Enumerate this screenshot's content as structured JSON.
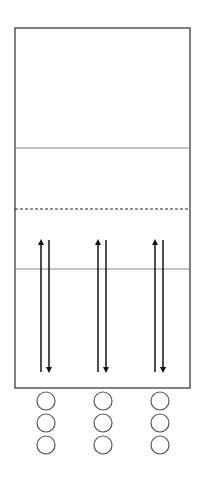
{
  "diagram": {
    "type": "court-drill-diagram",
    "colors": {
      "stroke": "#555555",
      "arrow": "#111111",
      "line": "#888888",
      "background": "#ffffff"
    },
    "court": {
      "x": 15,
      "y": 28,
      "width": 175,
      "height": 360
    },
    "lines": [
      {
        "name": "line-upper",
        "y": 148,
        "style": "solid"
      },
      {
        "name": "line-dashed",
        "y": 209,
        "style": "dashed"
      },
      {
        "name": "line-lower",
        "y": 269,
        "style": "solid"
      }
    ],
    "columns": [
      {
        "name": "column-1",
        "up_x": 41,
        "down_x": 49,
        "circle_x": 46
      },
      {
        "name": "column-2",
        "up_x": 98,
        "down_x": 106,
        "circle_x": 103
      },
      {
        "name": "column-3",
        "up_x": 155,
        "down_x": 163,
        "circle_x": 160
      }
    ],
    "arrows": {
      "up_top": 238,
      "up_bottom": 372,
      "down_top": 240,
      "down_bottom": 374
    },
    "players": {
      "rows_y": [
        401,
        423,
        445
      ],
      "radius": 9
    }
  }
}
